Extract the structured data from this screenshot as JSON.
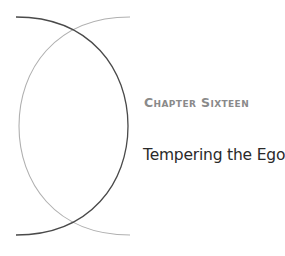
{
  "chapter": {
    "label": "Chapter Sixteen",
    "title": "Tempering the Ego"
  },
  "decoration": {
    "arc_dark_color": "#4a4a4a",
    "arc_light_color": "#b0b0b0"
  }
}
